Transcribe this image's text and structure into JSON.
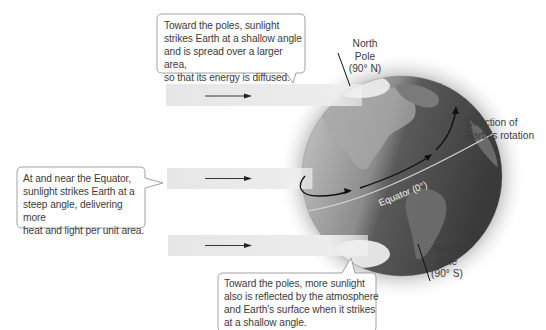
{
  "diagram": {
    "callouts": {
      "top": {
        "lines": [
          "Toward the poles, sunlight",
          "strikes Earth at a shallow angle",
          "and is spread over a larger area,",
          "so that its energy is diffused."
        ]
      },
      "left": {
        "lines": [
          "At and near the Equator,",
          "sunlight strikes Earth at a",
          "steep angle, delivering more",
          "heat and light per unit area."
        ]
      },
      "bottom": {
        "lines": [
          "Toward the poles, more sunlight",
          "also is reflected by the atmosphere",
          "and Earth's surface when it strikes",
          "at a shallow angle."
        ]
      }
    },
    "labels": {
      "north_pole": [
        "North",
        "Pole",
        "(90° N)"
      ],
      "south_pole": [
        "South",
        "Pole",
        "(90° S)"
      ],
      "rotation": [
        "Direction of",
        "Earth's rotation"
      ],
      "equator": "Equator (0°)"
    },
    "sunlight_bands": [
      {
        "position": "top",
        "arrow": "right"
      },
      {
        "position": "middle",
        "arrow": "right"
      },
      {
        "position": "bottom",
        "arrow": "right"
      }
    ],
    "colors": {
      "band": "#e9e9e9",
      "globe_dark": "#4a4a4a",
      "globe_light": "#b8b8b8",
      "callout_border": "#8a8a8a",
      "text": "#3c3c3c"
    }
  }
}
